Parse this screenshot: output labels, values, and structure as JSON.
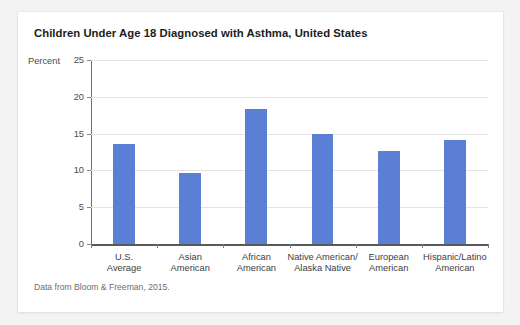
{
  "card": {
    "title": "Children Under Age 18 Diagnosed with Asthma, United States",
    "source": "Data from Bloom & Freeman, 2015."
  },
  "chart_data": {
    "type": "bar",
    "title": "Children Under Age 18 Diagnosed with Asthma, United States",
    "subtitle": "",
    "xlabel": "",
    "ylabel": "Percent",
    "ylim": [
      0,
      25
    ],
    "yticks": [
      0,
      5,
      10,
      15,
      20,
      25
    ],
    "ytick_labels": [
      "0",
      "5",
      "10",
      "15",
      "20",
      "25"
    ],
    "grid": true,
    "legend": false,
    "legend_position": "none",
    "bar_color": "#5b7fd4",
    "categories": [
      "U.S.\nAverage",
      "Asian\nAmerican",
      "African\nAmerican",
      "Native American/\nAlaska Native",
      "European\nAmerican",
      "Hispanic/Latino\nAmerican"
    ],
    "values": [
      13.6,
      9.7,
      18.4,
      15.0,
      12.6,
      14.1
    ],
    "annotations": [
      "Data from Bloom & Freeman, 2015."
    ]
  }
}
